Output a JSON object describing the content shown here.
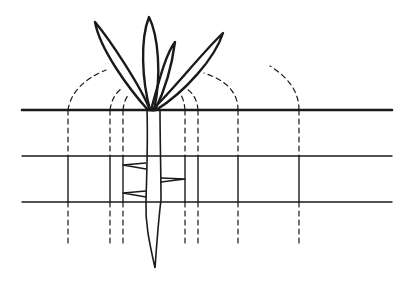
{
  "diagram": {
    "colors": {
      "stroke": "#1a1a1a",
      "background": "#ffffff"
    },
    "surface_line": {
      "y": 110,
      "x1": 22,
      "x2": 392,
      "width": 2.6
    },
    "layer_lines": [
      {
        "y": 156,
        "x1": 22,
        "x2": 392,
        "width": 1.4
      },
      {
        "y": 202,
        "x1": 22,
        "x2": 392,
        "width": 1.4
      }
    ],
    "verticals": [
      68,
      110,
      123,
      185,
      198,
      238,
      299
    ],
    "vertical_solid_range": [
      110,
      202
    ],
    "vertical_dashed_bottom": 246,
    "plant": {
      "base": [
        150,
        110
      ],
      "leaves": 4,
      "root_tip": [
        155,
        268
      ]
    }
  }
}
